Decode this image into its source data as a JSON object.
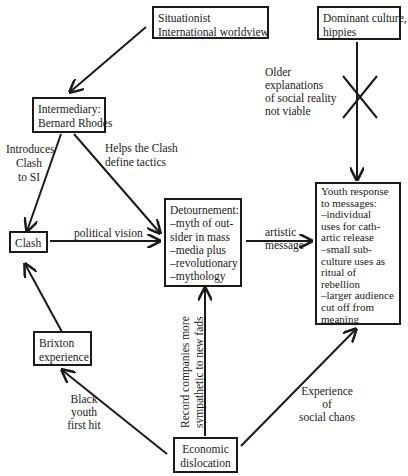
{
  "nodes": {
    "situationist": {
      "lines": [
        "Situationist",
        "International worldview"
      ]
    },
    "dominant": {
      "lines": [
        "Dominant culture,",
        "hippies"
      ]
    },
    "intermediary": {
      "lines": [
        "Intermediary:",
        "Bernard Rhodes"
      ]
    },
    "clash": {
      "lines": [
        "Clash"
      ]
    },
    "detournement": {
      "lines": [
        "Detournement:",
        "–myth of out-",
        "sider in mass",
        "–media plus",
        "–revolutionary",
        "–mythology"
      ]
    },
    "youth": {
      "lines": [
        "Youth response",
        "to messages:",
        "–individual",
        "uses for cath-",
        "artic release",
        "–small sub-",
        "culture uses as",
        "ritual of",
        "rebellion",
        "–larger audience",
        "cut off from",
        "meaning"
      ]
    },
    "brixton": {
      "lines": [
        "Brixton",
        "experience"
      ]
    },
    "economic": {
      "lines": [
        "Economic",
        "dislocation"
      ]
    }
  },
  "edge_labels": {
    "older": {
      "lines": [
        "Older",
        "explanations",
        "of social reality",
        "not viable"
      ]
    },
    "introduces": {
      "lines": [
        "Introduces",
        "Clash",
        "to SI"
      ]
    },
    "helps": {
      "lines": [
        "Helps the Clash",
        "define tactics"
      ]
    },
    "political": {
      "lines": [
        "political vision"
      ]
    },
    "artistic": {
      "lines": [
        "artistic",
        "message"
      ]
    },
    "record": {
      "lines": [
        "Record companies more",
        "sympathetic to new fads"
      ]
    },
    "black_youth": {
      "lines": [
        "Black",
        "youth",
        "first hit"
      ]
    },
    "social_chaos": {
      "lines": [
        "Experience",
        "of",
        "social chaos"
      ]
    }
  },
  "colors": {
    "ink": "#1a1a1a",
    "background": "#ffffff"
  }
}
